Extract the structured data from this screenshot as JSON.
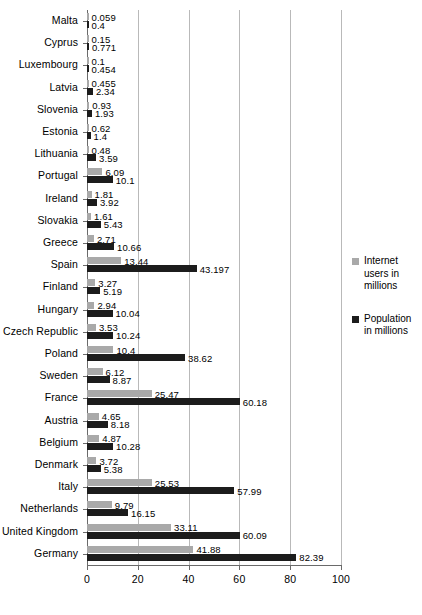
{
  "chart_data": {
    "type": "bar",
    "orientation": "horizontal",
    "title": "",
    "xlabel": "",
    "ylabel": "",
    "xlim": [
      0,
      100
    ],
    "xticks": [
      0,
      20,
      40,
      60,
      80,
      100
    ],
    "grid": true,
    "legend_position": "right",
    "categories": [
      "Malta",
      "Cyprus",
      "Luxembourg",
      "Latvia",
      "Slovenia",
      "Estonia",
      "Lithuania",
      "Portugal",
      "Ireland",
      "Slovakia",
      "Greece",
      "Spain",
      "Finland",
      "Hungary",
      "Czech Republic",
      "Poland",
      "Sweden",
      "France",
      "Austria",
      "Belgium",
      "Denmark",
      "Italy",
      "Netherlands",
      "United Kingdom",
      "Germany"
    ],
    "series": [
      {
        "name": "Internet users in millions",
        "color": "#a9a9a9",
        "values": [
          0.059,
          0.15,
          0.1,
          0.455,
          0.93,
          0.62,
          0.48,
          6.09,
          1.81,
          1.61,
          2.71,
          13.44,
          3.27,
          2.94,
          3.53,
          10.4,
          6.12,
          25.47,
          4.65,
          4.87,
          3.72,
          25.53,
          9.79,
          33.11,
          41.88
        ],
        "labels": [
          "0.059",
          "0.15",
          "0.1",
          "0.455",
          "0.93",
          "0.62",
          "0.48",
          "6.09",
          "1.81",
          "1.61",
          "2.71",
          "13.44",
          "3.27",
          "2.94",
          "3.53",
          "10.4",
          "6.12",
          "25.47",
          "4.65",
          "4.87",
          "3.72",
          "25.53",
          "9.79",
          "33.11",
          "41.88"
        ]
      },
      {
        "name": "Population in millions",
        "color": "#1c1c1c",
        "values": [
          0.4,
          0.771,
          0.454,
          2.34,
          1.93,
          1.4,
          3.59,
          10.1,
          3.92,
          5.43,
          10.66,
          43.197,
          5.19,
          10.04,
          10.24,
          38.62,
          8.87,
          60.18,
          8.18,
          10.28,
          5.38,
          57.99,
          16.15,
          60.09,
          82.39
        ],
        "labels": [
          "0.4",
          "0.771",
          "0.454",
          "2.34",
          "1.93",
          "1.4",
          "3.59",
          "10.1",
          "3.92",
          "5.43",
          "10.66",
          "43.197",
          "5.19",
          "10.04",
          "10.24",
          "38.62",
          "8.87",
          "60.18",
          "8.18",
          "10.28",
          "5.38",
          "57.99",
          "16.15",
          "60.09",
          "82.39"
        ]
      }
    ]
  },
  "legend": {
    "entries": [
      {
        "label": "Internet users in millions",
        "swatch": "internet"
      },
      {
        "label": "Population in millions",
        "swatch": "population"
      }
    ]
  }
}
